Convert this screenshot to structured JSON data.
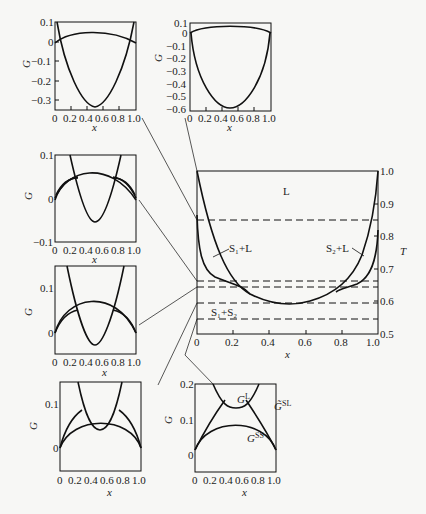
{
  "figure": {
    "main_panel": {
      "xlabel": "x",
      "ylabel": "T",
      "x_ticks": [
        "0",
        "0.2",
        "0.4",
        "0.6",
        "0.8",
        "1.0"
      ],
      "y_ticks": [
        "0.5",
        "0.6",
        "0.7",
        "0.8",
        "0.9",
        "1.0"
      ],
      "regions": {
        "liquid": "L",
        "s1_l": "S₁+L",
        "s2_l": "S₂+L",
        "s1_s2": "S₁+S₂"
      },
      "dashed_temperatures": [
        0.85,
        0.665,
        0.645,
        0.595,
        0.545
      ]
    },
    "panels": [
      {
        "id": "p1",
        "ylabel": "G",
        "xlabel": "x",
        "y_ticks": [
          "0.1",
          "0",
          "−0.1",
          "−0.2",
          "−0.3"
        ],
        "x_ticks": [
          "0",
          "0.2",
          "0.4",
          "0.6",
          "0.8",
          "1.0"
        ]
      },
      {
        "id": "p2",
        "ylabel": "G",
        "xlabel": "x",
        "y_ticks": [
          "0.1",
          "0",
          "−0.1",
          "−0.2",
          "−0.3",
          "−0.4",
          "−0.5",
          "−0.6"
        ],
        "x_ticks": [
          "0",
          "0.2",
          "0.4",
          "0.6",
          "0.8",
          "1.0"
        ]
      },
      {
        "id": "p3",
        "ylabel": "G",
        "xlabel": "x",
        "y_ticks": [
          "0.1",
          "0",
          "−0.1"
        ],
        "x_ticks": [
          "0",
          "0.2",
          "0.4",
          "0.6",
          "0.8",
          "1.0"
        ]
      },
      {
        "id": "p4",
        "ylabel": "G",
        "xlabel": "x",
        "y_ticks": [
          "0.1",
          "0"
        ],
        "x_ticks": [
          "0",
          "0.2",
          "0.4",
          "0.6",
          "0.8",
          "1.0"
        ]
      },
      {
        "id": "p5",
        "ylabel": "G",
        "xlabel": "x",
        "y_ticks": [
          "0.1",
          "0"
        ],
        "x_ticks": [
          "0",
          "0.2",
          "0.4",
          "0.6",
          "0.8",
          "1.0"
        ]
      },
      {
        "id": "p6",
        "ylabel": "G",
        "xlabel": "x",
        "y_ticks": [
          "0.2",
          "0.1",
          "0"
        ],
        "x_ticks": [
          "0",
          "0.2",
          "0.4",
          "0.6",
          "0.8",
          "1.0"
        ],
        "curve_labels": {
          "liquid": "G",
          "liquid_sup": "L",
          "sl": "G̃",
          "sl_sup": "SL",
          "ss": "G",
          "ss_sup": "SS"
        }
      }
    ]
  }
}
